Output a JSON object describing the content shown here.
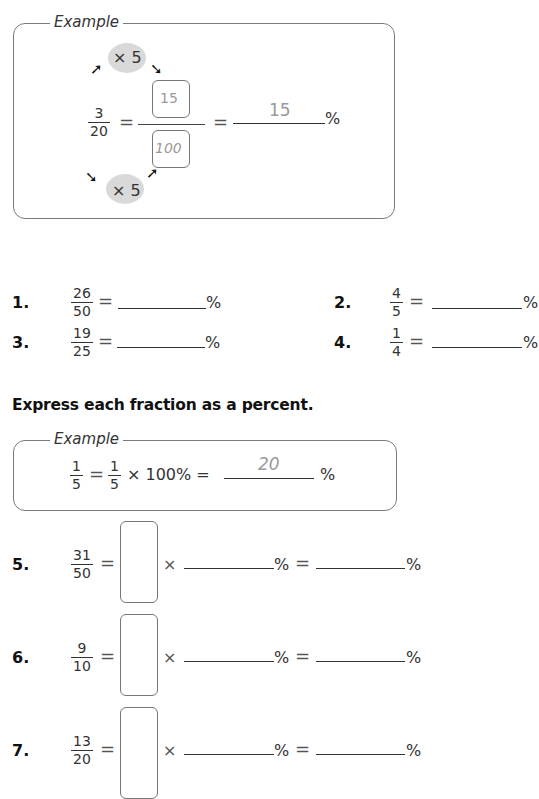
{
  "example1": {
    "legend": "Example",
    "multiplier_top": "× 5",
    "multiplier_bottom": "× 5",
    "fraction": {
      "num": "3",
      "den": "20"
    },
    "equals": "=",
    "box_numerator": "15",
    "box_denominator": "100",
    "answer": "15",
    "percent": "%"
  },
  "exercises_a": [
    {
      "label": "1.",
      "num": "26",
      "den": "50",
      "equals": "=",
      "percent": "%"
    },
    {
      "label": "2.",
      "num": "4",
      "den": "5",
      "equals": "=",
      "percent": "%"
    },
    {
      "label": "3.",
      "num": "19",
      "den": "25",
      "equals": "=",
      "percent": "%"
    },
    {
      "label": "4.",
      "num": "1",
      "den": "4",
      "equals": "=",
      "percent": "%"
    }
  ],
  "section_heading": "Express each fraction as a percent.",
  "example2": {
    "legend": "Example",
    "fraction": {
      "num": "1",
      "den": "5"
    },
    "equals": "=",
    "fraction2": {
      "num": "1",
      "den": "5"
    },
    "times_100": "× 100% =",
    "answer": "20",
    "percent": "%"
  },
  "exercises_b": [
    {
      "label": "5.",
      "num": "31",
      "den": "50",
      "equals": "=",
      "times": "×",
      "percent1": "%",
      "equals2": "=",
      "percent2": "%"
    },
    {
      "label": "6.",
      "num": "9",
      "den": "10",
      "equals": "=",
      "times": "×",
      "percent1": "%",
      "equals2": "=",
      "percent2": "%"
    },
    {
      "label": "7.",
      "num": "13",
      "den": "20",
      "equals": "=",
      "times": "×",
      "percent1": "%",
      "equals2": "=",
      "percent2": "%"
    }
  ],
  "icons": {
    "arrow_ne": "➚",
    "arrow_se": "➘"
  }
}
